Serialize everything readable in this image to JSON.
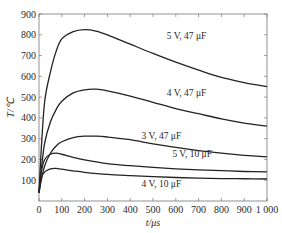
{
  "chart_data": {
    "type": "line",
    "title": "",
    "xlabel": "t/μs",
    "ylabel": "T/℃",
    "xlim": [
      0,
      1000
    ],
    "ylim": [
      0,
      900
    ],
    "xticks": [
      0,
      100,
      200,
      300,
      400,
      500,
      600,
      700,
      800,
      900,
      1000
    ],
    "xtick_labels": [
      "0",
      "100",
      "200",
      "300",
      "400",
      "500",
      "600",
      "700",
      "800",
      "900",
      "1 000"
    ],
    "yticks": [
      100,
      200,
      300,
      400,
      500,
      600,
      700,
      800,
      900
    ],
    "ytick_labels": [
      "100",
      "200",
      "300",
      "400",
      "500",
      "600",
      "700",
      "800",
      "900"
    ],
    "grid": false,
    "legend": "inline labels",
    "series": [
      {
        "name": "5 V, 47 μF",
        "x": [
          0,
          10,
          25,
          50,
          75,
          100,
          150,
          200,
          250,
          300,
          400,
          500,
          600,
          700,
          800,
          900,
          1000
        ],
        "y": [
          40,
          250,
          480,
          620,
          720,
          780,
          815,
          825,
          818,
          800,
          755,
          710,
          668,
          630,
          595,
          570,
          550
        ],
        "label_pos": {
          "x": 560,
          "y": 780
        }
      },
      {
        "name": "4 V, 47 μF",
        "x": [
          0,
          10,
          25,
          50,
          75,
          100,
          150,
          200,
          250,
          300,
          400,
          500,
          600,
          700,
          800,
          900,
          1000
        ],
        "y": [
          40,
          150,
          280,
          380,
          440,
          480,
          520,
          535,
          538,
          530,
          505,
          475,
          445,
          420,
          395,
          375,
          360
        ],
        "label_pos": {
          "x": 560,
          "y": 505
        }
      },
      {
        "name": "3 V, 47 μF",
        "x": [
          0,
          10,
          25,
          50,
          75,
          100,
          150,
          200,
          250,
          300,
          400,
          500,
          600,
          700,
          800,
          900,
          1000
        ],
        "y": [
          40,
          100,
          170,
          230,
          265,
          285,
          305,
          312,
          312,
          308,
          295,
          275,
          258,
          242,
          230,
          220,
          212
        ],
        "label_pos": {
          "x": 450,
          "y": 300
        }
      },
      {
        "name": "5 V, 10 μF",
        "x": [
          0,
          10,
          25,
          50,
          75,
          100,
          150,
          200,
          300,
          400,
          500,
          600,
          700,
          800,
          900,
          1000
        ],
        "y": [
          40,
          140,
          200,
          225,
          230,
          225,
          210,
          198,
          180,
          170,
          162,
          155,
          150,
          146,
          142,
          140
        ],
        "label_pos": {
          "x": 585,
          "y": 210
        }
      },
      {
        "name": "4 V, 10 μF",
        "x": [
          0,
          10,
          25,
          50,
          75,
          100,
          150,
          200,
          300,
          400,
          500,
          600,
          700,
          800,
          900,
          1000
        ],
        "y": [
          40,
          110,
          140,
          155,
          157,
          153,
          145,
          138,
          128,
          122,
          117,
          113,
          110,
          108,
          107,
          106
        ],
        "label_pos": {
          "x": 450,
          "y": 65
        }
      }
    ]
  }
}
